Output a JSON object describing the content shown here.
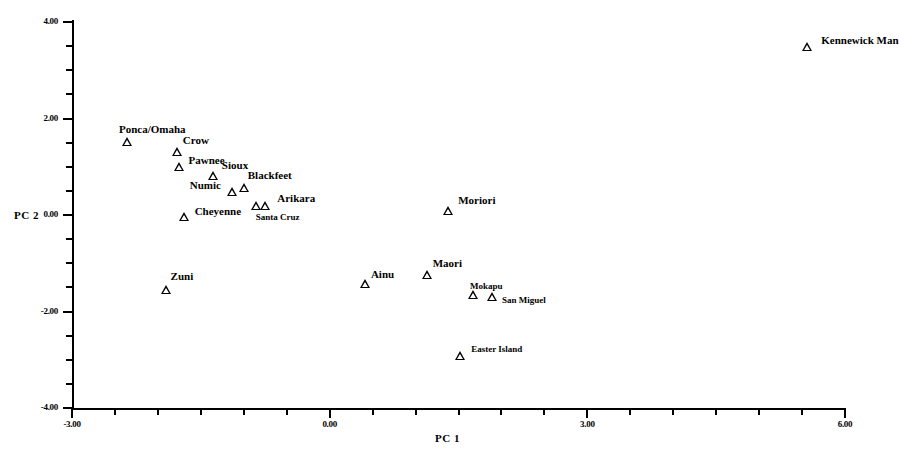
{
  "chart_data": {
    "type": "scatter",
    "title": "",
    "xlabel": "PC  1",
    "ylabel": "PC  2",
    "xlim": [
      -3.0,
      6.0
    ],
    "ylim": [
      -4.0,
      4.0
    ],
    "grid": false,
    "legend": "none",
    "marker": "open-triangle",
    "xticks": [
      "-3.00",
      "0.00",
      "3.00",
      "6.00"
    ],
    "xtick_values": [
      -3.0,
      0.0,
      3.0,
      6.0
    ],
    "xtick_minor_step": 0.5,
    "yticks": [
      "4.00",
      "2.00",
      "0.00",
      "-2.00",
      "-4.00"
    ],
    "ytick_values": [
      4.0,
      2.0,
      0.0,
      -2.0,
      -4.0
    ],
    "ytick_minor_step": 0.5,
    "points": [
      {
        "label": "Kennewick Man",
        "x": 5.56,
        "y": 3.49,
        "lx": 14,
        "ly": -12,
        "size": "lg"
      },
      {
        "label": "Ponca/Omaha",
        "x": -2.36,
        "y": 1.52,
        "lx": -8,
        "ly": -18,
        "size": "lg"
      },
      {
        "label": "Crow",
        "x": -1.78,
        "y": 1.31,
        "lx": 6,
        "ly": -17,
        "size": "lg"
      },
      {
        "label": "Pawnee",
        "x": -1.76,
        "y": 0.99,
        "lx": 10,
        "ly": -12,
        "size": "lg"
      },
      {
        "label": "Sioux",
        "x": -1.36,
        "y": 0.81,
        "lx": 9,
        "ly": -16,
        "size": "lg"
      },
      {
        "label": "Blackfeet",
        "x": -1.0,
        "y": 0.56,
        "lx": 4,
        "ly": -18,
        "size": "lg"
      },
      {
        "label": "Numic",
        "x": -1.14,
        "y": 0.47,
        "lx": -42,
        "ly": -12,
        "size": "lg"
      },
      {
        "label": "Arikara",
        "x": -0.75,
        "y": 0.18,
        "lx": 12,
        "ly": -13,
        "size": "lg"
      },
      {
        "label": "Santa Cruz",
        "x": -0.86,
        "y": 0.18,
        "lx": 0,
        "ly": 6,
        "size": "sm"
      },
      {
        "label": "Cheyenne",
        "x": -1.7,
        "y": -0.04,
        "lx": 11,
        "ly": -11,
        "size": "lg"
      },
      {
        "label": "Zuni",
        "x": -1.91,
        "y": -1.55,
        "lx": 5,
        "ly": -19,
        "size": "lg"
      },
      {
        "label": "Moriori",
        "x": 1.38,
        "y": 0.09,
        "lx": 10,
        "ly": -16,
        "size": "lg"
      },
      {
        "label": "Ainu",
        "x": 0.41,
        "y": -1.43,
        "lx": 6,
        "ly": -15,
        "size": "lg"
      },
      {
        "label": "Maori",
        "x": 1.13,
        "y": -1.24,
        "lx": 6,
        "ly": -17,
        "size": "lg"
      },
      {
        "label": "Mokapu",
        "x": 1.67,
        "y": -1.65,
        "lx": -3,
        "ly": -14,
        "size": "sm"
      },
      {
        "label": "San Miguel",
        "x": 1.89,
        "y": -1.69,
        "lx": 10,
        "ly": -2,
        "size": "sm"
      },
      {
        "label": "Easter Island",
        "x": 1.52,
        "y": -2.92,
        "lx": 11,
        "ly": -12,
        "size": "sm"
      }
    ]
  }
}
